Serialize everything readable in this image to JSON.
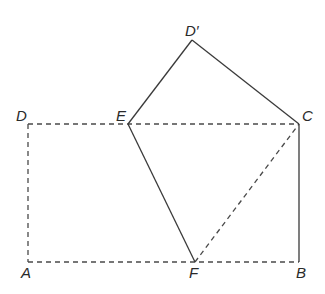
{
  "diagram": {
    "type": "geometry-fold",
    "points": {
      "D_prime": {
        "label": "D′",
        "x": 192,
        "y": 40
      },
      "D": {
        "label": "D",
        "x": 28,
        "y": 124
      },
      "E": {
        "label": "E",
        "x": 128,
        "y": 124
      },
      "C": {
        "label": "C",
        "x": 299,
        "y": 124
      },
      "A": {
        "label": "A",
        "x": 28,
        "y": 262
      },
      "F": {
        "label": "F",
        "x": 195,
        "y": 262
      },
      "B": {
        "label": "B",
        "x": 299,
        "y": 262
      }
    },
    "solid_segments": [
      [
        "D'",
        "E"
      ],
      [
        "D'",
        "C"
      ],
      [
        "E",
        "F"
      ],
      [
        "C",
        "B"
      ]
    ],
    "dashed_segments": [
      [
        "D",
        "C"
      ],
      [
        "D",
        "A"
      ],
      [
        "A",
        "B"
      ],
      [
        "F",
        "C"
      ]
    ]
  }
}
